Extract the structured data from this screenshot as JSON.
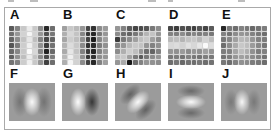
{
  "figure": {
    "colors": {
      "background": "#ffffff",
      "frame_border": "#a9a9a9",
      "gabor_base_gray": "#9b9b9b",
      "label_color": "#111111"
    },
    "top_panels": [
      {
        "label": "A",
        "grid": [
          [
            90,
            130,
            200,
            235,
            200,
            140,
            40,
            110
          ],
          [
            110,
            150,
            210,
            245,
            210,
            150,
            80,
            120
          ],
          [
            100,
            140,
            195,
            230,
            190,
            130,
            70,
            100
          ],
          [
            85,
            125,
            205,
            240,
            205,
            145,
            60,
            115
          ],
          [
            105,
            135,
            200,
            250,
            215,
            135,
            35,
            105
          ],
          [
            95,
            145,
            190,
            235,
            195,
            140,
            75,
            125
          ],
          [
            115,
            130,
            205,
            240,
            200,
            150,
            65,
            110
          ]
        ]
      },
      {
        "label": "B",
        "grid": [
          [
            160,
            200,
            185,
            150,
            70,
            50,
            140,
            155
          ],
          [
            175,
            215,
            195,
            135,
            55,
            40,
            120,
            150
          ],
          [
            165,
            205,
            190,
            145,
            65,
            30,
            135,
            160
          ],
          [
            180,
            220,
            200,
            140,
            50,
            45,
            125,
            145
          ],
          [
            170,
            230,
            195,
            130,
            60,
            35,
            130,
            155
          ],
          [
            185,
            240,
            205,
            145,
            55,
            50,
            140,
            150
          ],
          [
            175,
            245,
            210,
            140,
            65,
            40,
            130,
            160
          ]
        ]
      },
      {
        "label": "C",
        "grid": [
          [
            150,
            130,
            90,
            70,
            75,
            85,
            120,
            140
          ],
          [
            140,
            110,
            100,
            120,
            140,
            180,
            195,
            150
          ],
          [
            60,
            120,
            140,
            160,
            190,
            200,
            160,
            140
          ],
          [
            130,
            150,
            185,
            200,
            195,
            150,
            130,
            145
          ],
          [
            140,
            175,
            205,
            190,
            150,
            110,
            100,
            130
          ],
          [
            190,
            200,
            160,
            120,
            90,
            120,
            140,
            150
          ],
          [
            150,
            170,
            25,
            110,
            130,
            150,
            145,
            140
          ]
        ]
      },
      {
        "label": "D",
        "grid": [
          [
            70,
            60,
            80,
            75,
            65,
            85,
            70,
            90
          ],
          [
            130,
            125,
            140,
            120,
            135,
            125,
            130,
            120
          ],
          [
            185,
            190,
            180,
            195,
            200,
            185,
            210,
            190
          ],
          [
            215,
            220,
            210,
            225,
            215,
            230,
            250,
            220
          ],
          [
            150,
            145,
            155,
            140,
            150,
            145,
            160,
            150
          ],
          [
            120,
            125,
            115,
            130,
            120,
            115,
            125,
            120
          ],
          [
            110,
            120,
            105,
            115,
            110,
            120,
            110,
            115
          ]
        ]
      },
      {
        "label": "E",
        "grid": [
          [
            40,
            120,
            110,
            130,
            120,
            105,
            115,
            125
          ],
          [
            130,
            115,
            140,
            150,
            145,
            130,
            120,
            110
          ],
          [
            120,
            135,
            160,
            185,
            180,
            150,
            130,
            125
          ],
          [
            110,
            140,
            170,
            200,
            190,
            155,
            135,
            120
          ],
          [
            125,
            130,
            165,
            190,
            175,
            145,
            125,
            130
          ],
          [
            115,
            125,
            150,
            160,
            155,
            140,
            130,
            115
          ],
          [
            120,
            110,
            130,
            145,
            140,
            125,
            120,
            110
          ]
        ]
      }
    ],
    "bottom_panels": [
      {
        "label": "F",
        "pattern": "vertical-bright-center"
      },
      {
        "label": "G",
        "pattern": "vertical-bright-left-dark-right"
      },
      {
        "label": "H",
        "pattern": "diagonal-45-bright-center"
      },
      {
        "label": "I",
        "pattern": "horizontal-bright-center"
      },
      {
        "label": "J",
        "pattern": "vertical-bright-center-small"
      }
    ]
  }
}
